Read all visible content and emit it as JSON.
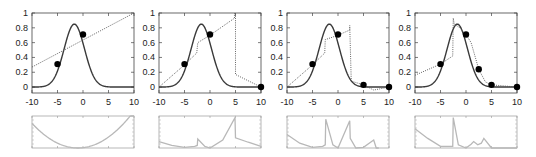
{
  "figure": {
    "colors": {
      "target_curve": "#3a3a3a",
      "approximation": "#555555",
      "samples": "#000000",
      "error_curve": "#b8b8b8",
      "axes": "#444444"
    }
  },
  "chart_data": [
    {
      "type": "line",
      "panel": 1,
      "xlim": [
        -10,
        10
      ],
      "ylim": [
        -0.08,
        1.0
      ],
      "xticks": [
        "-10",
        "-5",
        "0",
        "5",
        "10"
      ],
      "yticks": [
        "0",
        "0.2",
        "0.4",
        "0.6",
        "0.8",
        "1"
      ],
      "grid": false,
      "series": [
        {
          "name": "target",
          "style": "solid",
          "function": "0.85*exp(-(x+1.7)^2/8)"
        },
        {
          "name": "approximation",
          "style": "dotted",
          "x": [
            -10,
            10
          ],
          "y": [
            0.27,
            1.0
          ]
        },
        {
          "name": "samples",
          "style": "markers",
          "x": [
            -5,
            0
          ],
          "y": [
            0.31,
            0.71
          ]
        }
      ],
      "error": {
        "ylim": [
          0,
          1
        ],
        "description": "parabolic error, minimum near x=-1",
        "x": [
          -10,
          -7.5,
          -5,
          -2.5,
          -1,
          0,
          2.5,
          5,
          7.5,
          10
        ],
        "y": [
          0.62,
          0.4,
          0.2,
          0.05,
          0.0,
          0.02,
          0.13,
          0.35,
          0.62,
          0.95
        ]
      }
    },
    {
      "type": "line",
      "panel": 2,
      "xlim": [
        -10,
        10
      ],
      "ylim": [
        -0.08,
        1.0
      ],
      "xticks": [
        "-10",
        "-5",
        "0",
        "5",
        "10"
      ],
      "yticks": [
        "0",
        "0.2",
        "0.4",
        "0.6",
        "0.8",
        "1"
      ],
      "grid": false,
      "series": [
        {
          "name": "target",
          "style": "solid",
          "function": "0.85*exp(-(x+1.7)^2/8)"
        },
        {
          "name": "approximation",
          "style": "dotted",
          "x": [
            -10,
            -5,
            -2.6,
            -2.4,
            0,
            4.8,
            4.8,
            5.0,
            5.0,
            10
          ],
          "y": [
            0.0,
            0.3,
            0.46,
            0.6,
            0.7,
            0.93,
            1.0,
            1.0,
            0.17,
            0.0
          ]
        },
        {
          "name": "samples",
          "style": "markers",
          "x": [
            -5,
            0,
            10
          ],
          "y": [
            0.31,
            0.71,
            0.0
          ]
        }
      ],
      "error": {
        "ylim": [
          0,
          1
        ],
        "x": [
          -10,
          -7.5,
          -5,
          -3,
          -2.5,
          -2.4,
          -1,
          0,
          2.5,
          4.9,
          5.0,
          7.5,
          10
        ],
        "y": [
          0.2,
          0.08,
          0.02,
          0.05,
          0.08,
          0.28,
          0.05,
          0.0,
          0.25,
          0.95,
          0.32,
          0.18,
          0.05
        ]
      }
    },
    {
      "type": "line",
      "panel": 3,
      "xlim": [
        -10,
        10
      ],
      "ylim": [
        -0.08,
        1.0
      ],
      "xticks": [
        "-10",
        "-5",
        "0",
        "5",
        "10"
      ],
      "yticks": [
        "0",
        "0.2",
        "0.4",
        "0.6",
        "0.8",
        "1"
      ],
      "grid": false,
      "series": [
        {
          "name": "target",
          "style": "solid",
          "function": "0.85*exp(-(x+1.7)^2/8)"
        },
        {
          "name": "approximation",
          "style": "dotted",
          "x": [
            -10,
            -5,
            -2.6,
            -2.5,
            0,
            2.3,
            2.3,
            2.6,
            5,
            7,
            10
          ],
          "y": [
            0.0,
            0.3,
            0.46,
            0.64,
            0.7,
            0.77,
            0.83,
            0.08,
            0.03,
            -0.04,
            0.0
          ]
        },
        {
          "name": "samples",
          "style": "markers",
          "x": [
            -5,
            0,
            5,
            10
          ],
          "y": [
            0.31,
            0.71,
            0.03,
            0.0
          ]
        }
      ],
      "error": {
        "ylim": [
          0,
          1
        ],
        "x": [
          -10,
          -7.5,
          -5,
          -3,
          -2.5,
          -2.4,
          -1,
          0,
          2.3,
          2.4,
          3.5,
          5,
          7,
          7.5,
          8
        ],
        "y": [
          0.42,
          0.15,
          0.02,
          0.05,
          0.1,
          0.9,
          0.1,
          0.0,
          0.85,
          0.3,
          0.0,
          0.02,
          0.25,
          0.0,
          0.0
        ]
      }
    },
    {
      "type": "line",
      "panel": 4,
      "xlim": [
        -10,
        10
      ],
      "ylim": [
        -0.08,
        1.0
      ],
      "xticks": [
        "-10",
        "-5",
        "0",
        "5",
        "10"
      ],
      "yticks": [
        "0",
        "0.2",
        "0.4",
        "0.6",
        "0.8",
        "1"
      ],
      "grid": false,
      "series": [
        {
          "name": "target",
          "style": "solid",
          "function": "0.85*exp(-(x+1.7)^2/8)"
        },
        {
          "name": "approximation",
          "style": "dotted",
          "x": [
            -10,
            -5,
            -2.6,
            -2.5,
            -2.3,
            -1.2,
            0,
            1.0,
            2.5,
            3.8,
            5,
            10
          ],
          "y": [
            0.16,
            0.31,
            0.42,
            0.93,
            0.85,
            0.8,
            0.71,
            0.6,
            0.24,
            0.07,
            0.03,
            0.0
          ]
        },
        {
          "name": "samples",
          "style": "markers",
          "x": [
            -5,
            0,
            2.5,
            5,
            10
          ],
          "y": [
            0.31,
            0.71,
            0.24,
            0.03,
            0.0
          ]
        }
      ],
      "error": {
        "ylim": [
          0,
          1
        ],
        "x": [
          -10,
          -7.5,
          -5,
          -3,
          -2.6,
          -2.5,
          -1.5,
          0,
          1,
          1.5,
          2.3,
          3,
          3.5,
          5,
          10
        ],
        "y": [
          0.6,
          0.3,
          0.05,
          0.05,
          0.05,
          0.95,
          0.1,
          0.0,
          0.12,
          0.2,
          0.1,
          0.15,
          0.3,
          0.0,
          0.0
        ]
      }
    }
  ]
}
